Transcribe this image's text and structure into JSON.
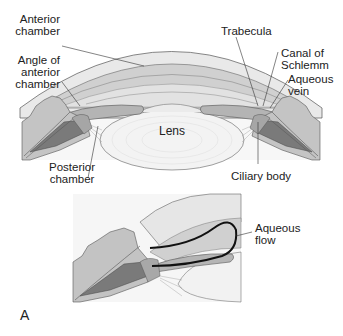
{
  "figure": {
    "panel_label": "A",
    "top_diagram": {
      "labels": {
        "anterior_chamber": [
          "Anterior",
          "chamber"
        ],
        "angle_of_anterior_chamber": [
          "Angle of",
          "anterior",
          "chamber"
        ],
        "trabecula": "Trabecula",
        "canal_of_schlemm": [
          "Canal of",
          "Schlemm"
        ],
        "aqueous_vein": [
          "Aqueous",
          "vein"
        ],
        "lens": "Lens",
        "posterior_chamber": [
          "Posterior",
          "chamber"
        ],
        "ciliary_body": "Ciliary body"
      }
    },
    "bottom_diagram": {
      "labels": {
        "aqueous_flow": [
          "Aqueous",
          "flow"
        ]
      }
    },
    "colors": {
      "cornea": "#e6e6e6",
      "anterior_chamber": "#d2d2d2",
      "iris": "#b5b5b5",
      "ciliary": "#7c7c7c",
      "lens": "#f1f1f1",
      "sclera": "#c6c6c6",
      "flow_line": "#111111"
    }
  }
}
